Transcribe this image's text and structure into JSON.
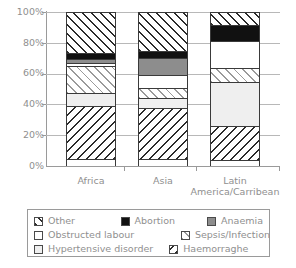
{
  "chart_data": {
    "type": "bar",
    "subtype": "stacked-100-percent",
    "title": "",
    "xlabel": "",
    "ylabel": "",
    "ylim": [
      0,
      100
    ],
    "ytick_labels": [
      "100%",
      "80%",
      "60%",
      "40%",
      "20%",
      "0%"
    ],
    "ytick_values": [
      100,
      80,
      60,
      40,
      20,
      0
    ],
    "grid": true,
    "legend_position": "bottom",
    "categories": [
      "Africa",
      "Asia",
      "Latin America/Carribean"
    ],
    "series": [
      {
        "name": "Other",
        "values": [
          27,
          26,
          9
        ]
      },
      {
        "name": "Abortion",
        "values": [
          5,
          5,
          11
        ]
      },
      {
        "name": "Anaemia",
        "values": [
          3,
          12,
          0
        ]
      },
      {
        "name": "Obstructed labour",
        "values": [
          3,
          9,
          18
        ]
      },
      {
        "name": "Sepsis/Infection",
        "values": [
          18,
          7,
          10
        ]
      },
      {
        "name": "Hypertensive disorder",
        "values": [
          9,
          7,
          29
        ]
      },
      {
        "name": "Haemorraghe",
        "values": [
          35,
          34,
          23
        ]
      }
    ]
  },
  "axis": {
    "y_labels": [
      "100%",
      "80%",
      "60%",
      "40%",
      "20%",
      "0%"
    ],
    "x_labels": [
      {
        "line1": "Africa",
        "line2": ""
      },
      {
        "line1": "Asia",
        "line2": ""
      },
      {
        "line1": "Latin",
        "line2": "America/Carribean"
      }
    ]
  },
  "legend": {
    "rows": [
      [
        {
          "label": "Other",
          "swatch": "hatch-forward-dark"
        },
        {
          "label": "Abortion",
          "swatch": "solid-black"
        },
        {
          "label": "Anaemia",
          "swatch": "solid-gray"
        }
      ],
      [
        {
          "label": "Obstructed labour",
          "swatch": "solid-white"
        },
        {
          "label": "Sepsis/Infection",
          "swatch": "hatch-forward-gray"
        }
      ],
      [
        {
          "label": "Hypertensive disorder",
          "swatch": "solid-lightgray"
        },
        {
          "label": "Haemorraghe",
          "swatch": "hatch-back-dark"
        }
      ]
    ]
  },
  "colors": {
    "abortion": "#111111",
    "anaemia": "#8d8d8d",
    "hypertensive": "#efefef",
    "obstructed": "#ffffff",
    "axis": "#9a9a9a",
    "grid": "#b8b8b8",
    "text": "#8f8f8f"
  }
}
